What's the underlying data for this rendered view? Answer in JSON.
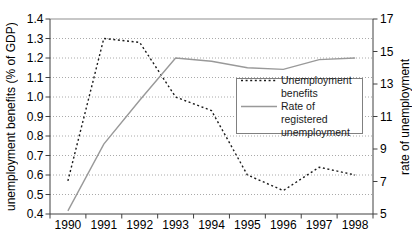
{
  "chart_data": {
    "type": "line",
    "categories": [
      "1990",
      "1991",
      "1992",
      "1993",
      "1994",
      "1995",
      "1996",
      "1997",
      "1998"
    ],
    "series": [
      {
        "name": "Unemployment benefits",
        "axis": "left",
        "line_style": "dashed",
        "color": "#1a1a1a",
        "values": [
          0.57,
          1.3,
          1.28,
          1.0,
          0.93,
          0.6,
          0.52,
          0.64,
          0.6
        ]
      },
      {
        "name": "Rate of registered unemployment",
        "axis": "right",
        "line_style": "solid",
        "color": "#999999",
        "values": [
          5.2,
          9.3,
          12.0,
          14.6,
          14.4,
          14.0,
          13.9,
          14.5,
          14.6
        ]
      }
    ],
    "left_axis": {
      "label": "unemployment benefits (% of GDP)",
      "min": 0.4,
      "max": 1.4,
      "tick_step": 0.1,
      "tick_labels": [
        "1.4",
        "1.3",
        "1.2",
        "1.1",
        "1.0",
        "0.9",
        "0.8",
        "0.7",
        "0.6",
        "0.5",
        "0.4"
      ]
    },
    "right_axis": {
      "label": "rate of unemployment",
      "min": 5,
      "max": 17,
      "tick_step": 2,
      "tick_labels": [
        "17",
        "15",
        "13",
        "11",
        "9",
        "7",
        "5"
      ]
    },
    "x_axis": {
      "tick_labels": [
        "1990",
        "1991",
        "1992",
        "1993",
        "1994",
        "1995",
        "1996",
        "1997",
        "1998"
      ]
    },
    "grid": "horizontal dotted",
    "title": "",
    "legend": {
      "position": "inside right",
      "items": [
        {
          "lines": [
            "Unemployment",
            "benefits"
          ],
          "style": "dashed"
        },
        {
          "lines": [
            "Rate of registered",
            "unemployment"
          ],
          "style": "solid"
        }
      ]
    }
  },
  "colors": {
    "background": "#ffffff",
    "grid": "#aaaaaa",
    "axis": "#404040",
    "frame": "#909090",
    "text": "#000000"
  }
}
